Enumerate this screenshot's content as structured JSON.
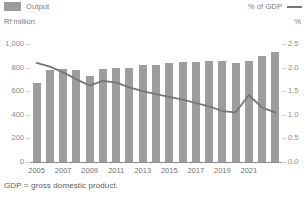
{
  "legend": {
    "series_bar_label": "Output",
    "series_line_label": "% of GDP",
    "bar_swatch_icon": "bar-swatch-icon",
    "line_swatch_icon": "line-swatch-icon"
  },
  "axes": {
    "left_unit": "Rf million",
    "right_unit": "%",
    "left_ticks": [
      "1,000",
      "800",
      "600",
      "400",
      "200",
      "0"
    ],
    "right_ticks": [
      "2.5",
      "2.0",
      "1.5",
      "1.0",
      "0.5",
      "0.0"
    ]
  },
  "footnote": "GDP = gross domestic product.",
  "colors": {
    "bar": "#9d9d9d",
    "line": "#767676",
    "axis": "#8c8c8c",
    "tick_text": "#8a8a8a",
    "label_text": "#6f6f6f"
  },
  "chart_data": {
    "type": "bar",
    "title": "",
    "subtitle": "",
    "xlabel": "",
    "ylabel": "Rf million",
    "y2label": "%",
    "ylim": [
      0,
      1000
    ],
    "y2lim": [
      0.0,
      2.5
    ],
    "grid": false,
    "legend_position": "top",
    "categories": [
      "2005",
      "2006",
      "2007",
      "2008",
      "2009",
      "2010",
      "2011",
      "2012",
      "2013",
      "2014",
      "2015",
      "2016",
      "2017",
      "2018",
      "2019",
      "2020",
      "2021",
      "2022",
      "2023"
    ],
    "x_tick_labels": [
      "2005",
      "2007",
      "2009",
      "2011",
      "2013",
      "2015",
      "2017",
      "2019",
      "2021"
    ],
    "series": [
      {
        "name": "Output",
        "type": "bar",
        "axis": "left",
        "unit": "Rf million",
        "values": [
          670,
          780,
          790,
          780,
          730,
          785,
          800,
          800,
          825,
          825,
          840,
          845,
          845,
          855,
          855,
          840,
          860,
          900,
          930
        ]
      },
      {
        "name": "% of GDP",
        "type": "line",
        "axis": "right",
        "unit": "%",
        "values": [
          2.1,
          2.02,
          1.9,
          1.75,
          1.62,
          1.72,
          1.68,
          1.58,
          1.5,
          1.44,
          1.38,
          1.32,
          1.25,
          1.18,
          1.08,
          1.05,
          1.42,
          1.15,
          1.05
        ]
      }
    ]
  }
}
